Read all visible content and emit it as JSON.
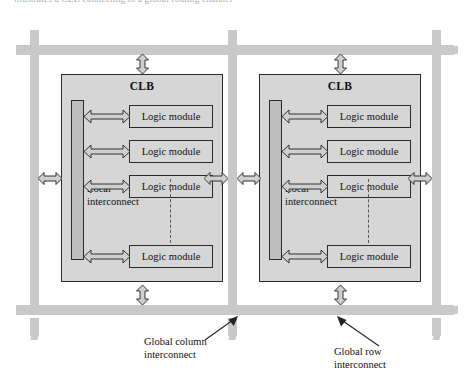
{
  "figure": {
    "cutoff_caption": "illustrates a CLB connecting to a global routing channel",
    "blocks": [
      {
        "id": "clb-left",
        "title": "CLB",
        "local_interconnect_label": "Local\ninterconnect",
        "local_interconnect_line1": "Local",
        "local_interconnect_line2": "interconnect",
        "logic_modules": [
          {
            "label": "Logic module"
          },
          {
            "label": "Logic module"
          },
          {
            "label": "Logic module"
          },
          {
            "label": "Logic module"
          }
        ]
      },
      {
        "id": "clb-right",
        "title": "CLB",
        "local_interconnect_line1": "Local",
        "local_interconnect_line2": "interconnect",
        "logic_modules": [
          {
            "label": "Logic module"
          },
          {
            "label": "Logic module"
          },
          {
            "label": "Logic module"
          },
          {
            "label": "Logic module"
          }
        ]
      }
    ],
    "callouts": [
      {
        "id": "global-column",
        "line1": "Global column",
        "line2": "interconnect"
      },
      {
        "id": "global-row",
        "line1": "Global row",
        "line2": "interconnect"
      }
    ],
    "colors": {
      "routing_bar": "#c9c9c9",
      "clb_fill": "#d6d6d6",
      "local_interconnect_fill": "#bdbdbd",
      "outline": "#2b2b2b",
      "arrow_fill": "#cfcfcf",
      "text": "#111111"
    }
  }
}
